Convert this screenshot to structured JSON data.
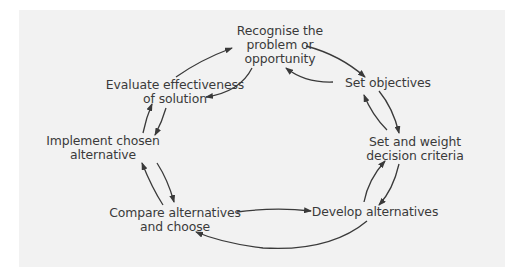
{
  "diagram": {
    "type": "cycle",
    "background_color": "#f2f2f2",
    "arrow_color": "#3a3a3a",
    "text_color": "#3a3a3a",
    "nodes": [
      {
        "id": "recognise",
        "lines": [
          "Recognise the",
          "problem or",
          "opportunity"
        ]
      },
      {
        "id": "objectives",
        "lines": [
          "Set objectives"
        ]
      },
      {
        "id": "criteria",
        "lines": [
          "Set and weight",
          "decision criteria"
        ]
      },
      {
        "id": "develop",
        "lines": [
          "Develop alternatives"
        ]
      },
      {
        "id": "compare",
        "lines": [
          "Compare alternatives",
          "and choose"
        ]
      },
      {
        "id": "implement",
        "lines": [
          "Implement chosen",
          "alternative"
        ]
      },
      {
        "id": "evaluate",
        "lines": [
          "Evaluate effectiveness",
          "of solution"
        ]
      }
    ],
    "edges": [
      {
        "from": "recognise",
        "to": "objectives"
      },
      {
        "from": "objectives",
        "to": "recognise"
      },
      {
        "from": "objectives",
        "to": "criteria"
      },
      {
        "from": "criteria",
        "to": "objectives"
      },
      {
        "from": "criteria",
        "to": "develop"
      },
      {
        "from": "develop",
        "to": "criteria"
      },
      {
        "from": "compare",
        "to": "develop"
      },
      {
        "from": "develop",
        "to": "compare"
      },
      {
        "from": "implement",
        "to": "compare"
      },
      {
        "from": "compare",
        "to": "implement"
      },
      {
        "from": "evaluate",
        "to": "implement"
      },
      {
        "from": "implement",
        "to": "evaluate"
      },
      {
        "from": "recognise",
        "to": "evaluate"
      },
      {
        "from": "evaluate",
        "to": "recognise"
      }
    ]
  }
}
